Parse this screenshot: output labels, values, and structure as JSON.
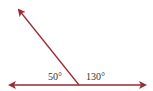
{
  "diagram": {
    "colors": {
      "line": "#9b2a35",
      "text": "#333333"
    },
    "angles": [
      {
        "label": "50°",
        "value": 50,
        "position": "left"
      },
      {
        "label": "130°",
        "value": 130,
        "position": "right"
      }
    ]
  }
}
